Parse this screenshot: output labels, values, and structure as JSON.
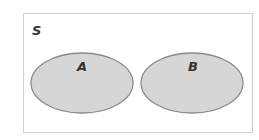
{
  "diagram": {
    "type": "venn",
    "universe": {
      "label": "S",
      "x": 23,
      "y": 13,
      "width": 229,
      "height": 119,
      "stroke": "#d0d0d0"
    },
    "sets": [
      {
        "label": "A",
        "cx": 82,
        "cy": 83,
        "rx": 51,
        "ry": 30,
        "fill": "#d6d6d6",
        "stroke": "#8a8a8a"
      },
      {
        "label": "B",
        "cx": 192,
        "cy": 83,
        "rx": 51,
        "ry": 30,
        "fill": "#d6d6d6",
        "stroke": "#8a8a8a"
      }
    ],
    "relationship": "disjoint"
  }
}
